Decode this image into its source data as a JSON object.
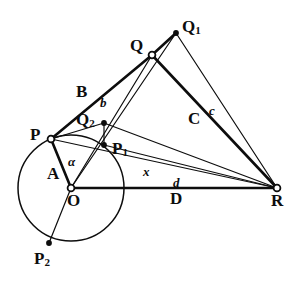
{
  "figure": {
    "background_color": "#ffffff",
    "ink_color": "#0d0d0d",
    "width": 291,
    "height": 291
  },
  "points": [
    {
      "id": "P",
      "label": "P",
      "sub": "",
      "x": 51,
      "y": 139,
      "marker": "open",
      "label_x": 30,
      "label_y": 126
    },
    {
      "id": "O",
      "label": "O",
      "sub": "",
      "x": 71,
      "y": 188,
      "marker": "open",
      "label_x": 67,
      "label_y": 192
    },
    {
      "id": "Q",
      "label": "Q",
      "sub": "",
      "x": 152,
      "y": 55,
      "marker": "open",
      "label_x": 130,
      "label_y": 37
    },
    {
      "id": "Q1",
      "label": "Q",
      "sub": "1",
      "x": 176,
      "y": 33,
      "marker": "filled",
      "label_x": 182,
      "label_y": 18
    },
    {
      "id": "Q2",
      "label": "Q",
      "sub": "2",
      "x": 104,
      "y": 123,
      "marker": "filled",
      "label_x": 76,
      "label_y": 111
    },
    {
      "id": "P1",
      "label": "P",
      "sub": "1",
      "x": 104,
      "y": 145,
      "marker": "filled",
      "label_x": 112,
      "label_y": 140
    },
    {
      "id": "P2",
      "label": "P",
      "sub": "2",
      "x": 49,
      "y": 243,
      "marker": "filled",
      "label_x": 34,
      "label_y": 250
    },
    {
      "id": "R",
      "label": "R",
      "sub": "",
      "x": 277,
      "y": 188,
      "marker": "open",
      "label_x": 271,
      "label_y": 192
    }
  ],
  "circle": {
    "name": "circle-centered-at-O",
    "cx": 71,
    "cy": 188,
    "r": 53
  },
  "segments": [
    {
      "name": "segment-P-O",
      "from": "P",
      "to": "O",
      "weight": "thick"
    },
    {
      "name": "segment-P-Q",
      "from": "P",
      "to": "Q",
      "weight": "thick"
    },
    {
      "name": "segment-Q-Q1",
      "from": "Q",
      "to": "Q1",
      "weight": "thick"
    },
    {
      "name": "segment-Q-R",
      "from": "Q",
      "to": "R",
      "weight": "thick"
    },
    {
      "name": "segment-Q1-R",
      "from": "Q1",
      "to": "R",
      "weight": "thin"
    },
    {
      "name": "segment-O-R",
      "from": "O",
      "to": "R",
      "weight": "thick"
    },
    {
      "name": "segment-O-Q1",
      "from": "O",
      "to": "Q1",
      "weight": "thin"
    },
    {
      "name": "segment-O-Q",
      "from": "O",
      "to": "Q",
      "weight": "thin"
    },
    {
      "name": "segment-O-P2",
      "from": "O",
      "to": "P2",
      "weight": "thin"
    },
    {
      "name": "segment-P-R",
      "from": "P",
      "to": "R",
      "weight": "thin"
    },
    {
      "name": "segment-Q2-R",
      "from": "Q2",
      "to": "R",
      "weight": "thin"
    },
    {
      "name": "segment-P1-R",
      "from": "P1",
      "to": "R",
      "weight": "thin"
    },
    {
      "name": "segment-Q2-P1",
      "from": "Q2",
      "to": "P1",
      "weight": "thin"
    },
    {
      "name": "segment-P-Q2",
      "from": "P",
      "to": "Q2",
      "weight": "thin"
    }
  ],
  "labels": [
    {
      "id": "label-A",
      "text": "A",
      "style": "upright",
      "x": 47,
      "y": 165
    },
    {
      "id": "label-alpha",
      "text": "α",
      "style": "italic",
      "x": 68,
      "y": 155
    },
    {
      "id": "label-B",
      "text": "B",
      "style": "upright",
      "x": 76,
      "y": 83
    },
    {
      "id": "label-b",
      "text": "b",
      "style": "italic",
      "x": 100,
      "y": 96
    },
    {
      "id": "label-C",
      "text": "C",
      "style": "upright",
      "x": 188,
      "y": 110
    },
    {
      "id": "label-c",
      "text": "c",
      "style": "italic",
      "x": 209,
      "y": 104
    },
    {
      "id": "label-x",
      "text": "x",
      "style": "italic",
      "x": 143,
      "y": 165
    },
    {
      "id": "label-d",
      "text": "d",
      "style": "italic",
      "x": 173,
      "y": 176
    },
    {
      "id": "label-D",
      "text": "D",
      "style": "upright",
      "x": 170,
      "y": 190
    }
  ],
  "caption": {
    "text": "",
    "visible": false
  }
}
